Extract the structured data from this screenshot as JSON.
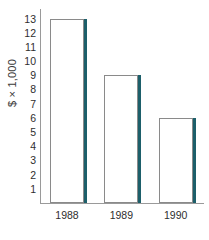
{
  "chart_data": {
    "type": "bar",
    "title": "",
    "xlabel": "",
    "ylabel": "$ × 1,000",
    "categories": [
      "1988",
      "1989",
      "1990"
    ],
    "values": [
      13,
      9,
      6
    ],
    "series": [
      {
        "name": "Amount",
        "values": [
          13,
          9,
          6
        ]
      }
    ],
    "ylim": [
      0,
      13.6
    ],
    "y_ticks": [
      1,
      2,
      3,
      4,
      5,
      6,
      7,
      8,
      9,
      10,
      11,
      12,
      13
    ],
    "y_tick_labels": [
      "1",
      "2",
      "3",
      "4",
      "5",
      "6",
      "7",
      "8",
      "9",
      "10",
      "11",
      "12",
      "13"
    ],
    "grid": false,
    "legend": null,
    "legend_position": "none",
    "colors": {
      "bar_fill": "#ffffff",
      "bar_outline": "#8a8a8a",
      "bar_shadow_edge": "#1d5f6a",
      "axis": "#9a9a9a",
      "text": "#2e2e2e",
      "background": "#ffffff"
    }
  },
  "axis": {
    "y_title": "$ × 1,000"
  }
}
